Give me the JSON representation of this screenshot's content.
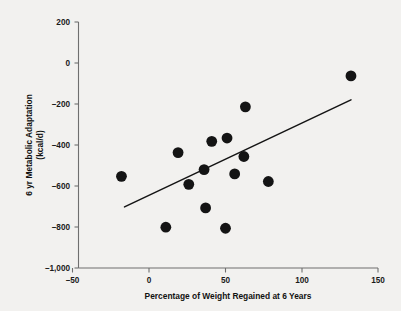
{
  "chart_data": {
    "type": "scatter",
    "title": "",
    "xlabel": "Percentage of Weight Regained at 6 Years",
    "ylabel": "6 yr Metabolic Adaptation (kcal/d)",
    "ylabel_line1": "6 yr Metabolic Adaptation",
    "ylabel_line2": "(kcal/d)",
    "xlim": [
      -50,
      150
    ],
    "ylim": [
      -1000,
      200
    ],
    "xticks": [
      -50,
      0,
      50,
      100,
      150
    ],
    "xticklabels": [
      "–50",
      "0",
      "50",
      "100",
      "150"
    ],
    "yticks": [
      200,
      0,
      -200,
      -400,
      -600,
      -800,
      -1000
    ],
    "yticklabels": [
      "200",
      "0",
      "–200",
      "–400",
      "–600",
      "–800",
      "–1,000"
    ],
    "grid": false,
    "legend": null,
    "marker_color": "#141414",
    "marker_size": 5.4,
    "points": [
      {
        "x": -18,
        "y": -553
      },
      {
        "x": 11,
        "y": -801
      },
      {
        "x": 19,
        "y": -437
      },
      {
        "x": 26,
        "y": -592
      },
      {
        "x": 36,
        "y": -520
      },
      {
        "x": 37,
        "y": -707
      },
      {
        "x": 41,
        "y": -382
      },
      {
        "x": 50,
        "y": -806
      },
      {
        "x": 51,
        "y": -366
      },
      {
        "x": 56,
        "y": -541
      },
      {
        "x": 62,
        "y": -456
      },
      {
        "x": 63,
        "y": -214
      },
      {
        "x": 78,
        "y": -578
      },
      {
        "x": 132,
        "y": -63
      }
    ],
    "fit_line": {
      "x_start": -16,
      "y_start": -702,
      "x_end": 132,
      "y_end": -180,
      "color": "#141414"
    }
  },
  "colors": {
    "background": "#f2f1ef",
    "axis": "#6f6f6f",
    "text": "#111111",
    "marker": "#141414"
  }
}
